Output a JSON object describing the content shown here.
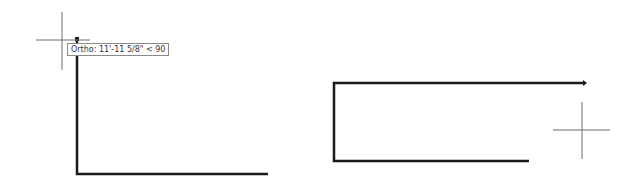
{
  "colors": {
    "background": "#ffffff",
    "polyline": "#1a1a1a",
    "crosshair": "#6e6e6e",
    "tooltip_border": "#8a8a8a",
    "tooltip_text": "#333333"
  },
  "left_view": {
    "crosshair": {
      "x": 62,
      "y": 40
    },
    "polyline_points": [
      [
        268,
        174
      ],
      [
        77,
        174
      ],
      [
        77,
        39
      ]
    ],
    "tooltip": {
      "text": "Ortho: 11'-11 5/8\" < 90"
    }
  },
  "right_view": {
    "crosshair": {
      "x": 582,
      "y": 130
    },
    "polyline_points": [
      [
        529,
        161
      ],
      [
        334,
        161
      ],
      [
        334,
        83
      ],
      [
        583,
        83
      ]
    ]
  }
}
